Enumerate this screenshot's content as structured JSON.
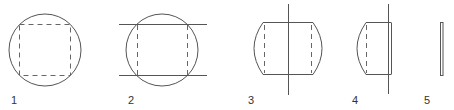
{
  "diagram": {
    "steps": [
      {
        "id": 1,
        "label": "1",
        "content": "circle with dashed inscribed square"
      },
      {
        "id": 2,
        "label": "2",
        "content": "circle cut by two horizontal lines, dashed vertical sides"
      },
      {
        "id": 3,
        "label": "3",
        "content": "barrel shape with vertical cutting line through center, dashed inner sides"
      },
      {
        "id": 4,
        "label": "4",
        "content": "half barrel with flat right face and dashed inner left side"
      },
      {
        "id": 5,
        "label": "5",
        "content": "thin vertical slab"
      }
    ],
    "colors": {
      "stroke": "#555555",
      "dash": "#666666",
      "label": "#333333",
      "background": "#ffffff"
    }
  }
}
